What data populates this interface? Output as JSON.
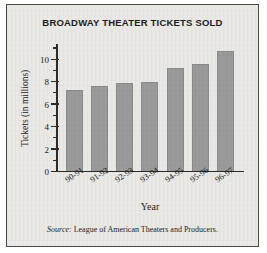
{
  "chart_data": {
    "type": "bar",
    "title": "BROADWAY THEATER TICKETS SOLD",
    "xlabel": "Year",
    "ylabel": "Tickets (in millions)",
    "categories": [
      "90-91",
      "91-92",
      "92-93",
      "93-94",
      "94-95",
      "95-96",
      "96-97"
    ],
    "values": [
      7.3,
      7.6,
      7.9,
      8.0,
      9.2,
      9.6,
      10.8
    ],
    "ylim": [
      0,
      11.4
    ],
    "ytick_labels": [
      "0",
      "2",
      "4",
      "6",
      "8",
      "10"
    ],
    "ytick_values": [
      0,
      2,
      4,
      6,
      8,
      10
    ],
    "yminor_values": [
      1,
      3,
      5,
      7,
      9,
      11
    ],
    "grid": false,
    "legend": "none",
    "bar_color": "#9a9a9a",
    "axis_color": "#2b2b29",
    "background_color": "#e9e8e4"
  },
  "source": {
    "prefix": "Source:",
    "text": "League of American Theaters and Producers."
  }
}
